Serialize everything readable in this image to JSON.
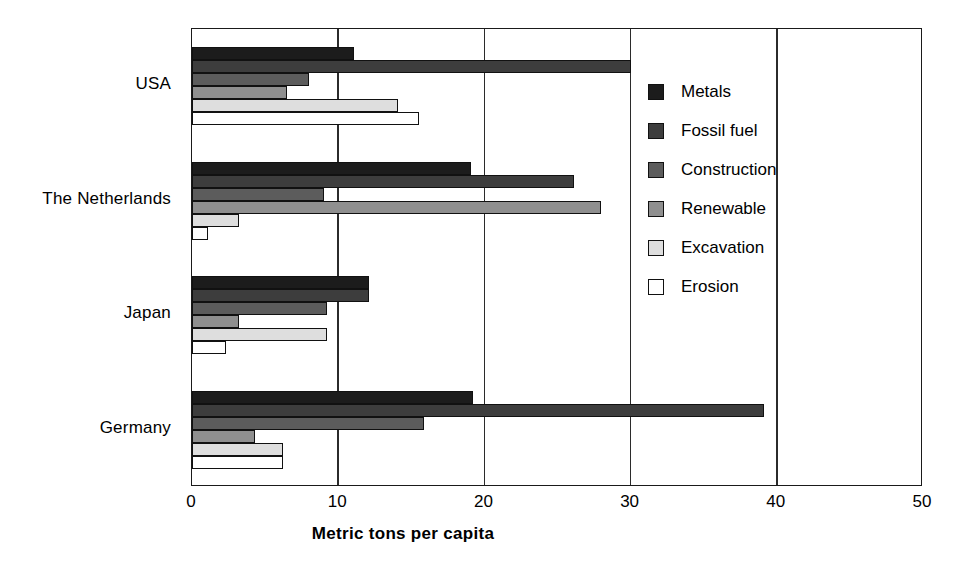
{
  "chart_data": {
    "type": "bar",
    "orientation": "horizontal",
    "title": "",
    "xlabel": "Metric tons per capita",
    "ylabel": "",
    "xlim": [
      0,
      50
    ],
    "xticks": [
      0,
      10,
      20,
      30,
      40,
      50
    ],
    "xtick_labels": [
      "0",
      "10",
      "20",
      "30",
      "40",
      "50"
    ],
    "grid": "vertical",
    "legend_position": "right",
    "categories": [
      "USA",
      "The Netherlands",
      "Japan",
      "Germany"
    ],
    "series": [
      {
        "name": "Metals",
        "color": "#1c1c1c",
        "values": [
          11.1,
          19.1,
          12.1,
          19.2
        ]
      },
      {
        "name": "Fossil fuel",
        "color": "#3d3d3d",
        "values": [
          30.0,
          26.1,
          12.1,
          39.1
        ]
      },
      {
        "name": "Construction",
        "color": "#5c5c5c",
        "values": [
          8.0,
          9.0,
          9.2,
          15.9
        ]
      },
      {
        "name": "Renewable",
        "color": "#8f8f8f",
        "values": [
          6.5,
          28.0,
          3.2,
          4.3
        ]
      },
      {
        "name": "Excavation",
        "color": "#dedede",
        "values": [
          14.1,
          3.2,
          9.2,
          6.2
        ]
      },
      {
        "name": "Erosion",
        "color": "#ffffff",
        "values": [
          15.5,
          1.1,
          2.3,
          6.2
        ]
      }
    ]
  },
  "legend": {
    "items": [
      {
        "label": "Metals",
        "swatch": "legend-swatch-metals"
      },
      {
        "label": "Fossil fuel",
        "swatch": "legend-swatch-fossil-fuel"
      },
      {
        "label": "Construction",
        "swatch": "legend-swatch-construction"
      },
      {
        "label": "Renewable",
        "swatch": "legend-swatch-renewable"
      },
      {
        "label": "Excavation",
        "swatch": "legend-swatch-excavation"
      },
      {
        "label": "Erosion",
        "swatch": "legend-swatch-erosion"
      }
    ]
  }
}
